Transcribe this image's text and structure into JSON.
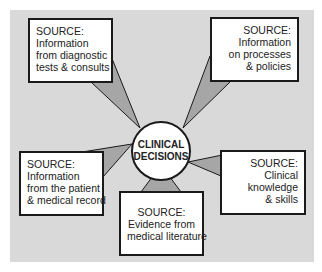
{
  "diagram": {
    "center": {
      "line1": "CLINICAL",
      "line2": "DECISIONS"
    },
    "sources": [
      {
        "position": "top-left",
        "lines": [
          "SOURCE:",
          "Information",
          "from diagnostic",
          "tests & consults"
        ]
      },
      {
        "position": "top-right",
        "lines": [
          "SOURCE:",
          "Information",
          "on processes",
          "&  policies"
        ]
      },
      {
        "position": "bottom-left",
        "lines": [
          "SOURCE:",
          "Information",
          "from the patient",
          "& medical record"
        ]
      },
      {
        "position": "bottom-center",
        "lines": [
          "SOURCE:",
          "Evidence from",
          "medical literature"
        ]
      },
      {
        "position": "bottom-right",
        "lines": [
          "SOURCE:",
          "Clinical",
          "knowledge",
          "& skills"
        ]
      }
    ],
    "colors": {
      "background": "#d9d9d9",
      "connector": "#a6a6a6",
      "border": "#1a1a1a"
    }
  }
}
